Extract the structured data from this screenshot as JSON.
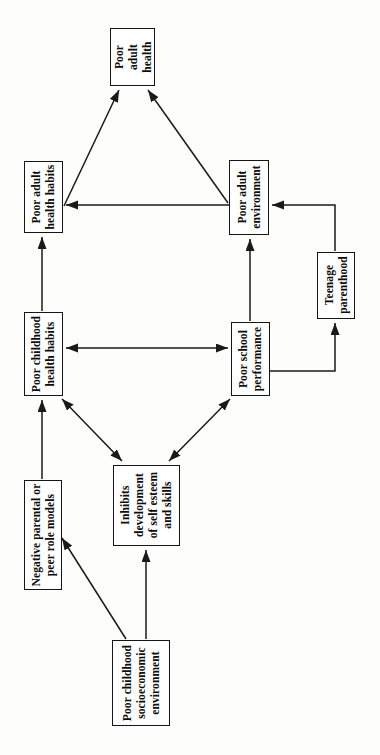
{
  "diagram": {
    "orientation": "rotated-90-counterclockwise",
    "style": {
      "box_border_color": "#151515",
      "box_fill_color": "#ffffff",
      "line_color": "#1a1a1a",
      "background_color": "#fdfdfb"
    },
    "nodes": [
      {
        "id": "poor-adult-health",
        "lines": [
          "Poor",
          "adult",
          "health"
        ],
        "x": 110,
        "y": 28,
        "w": 45,
        "h": 58
      },
      {
        "id": "poor-adult-health-habits",
        "lines": [
          "Poor adult",
          "health habits"
        ],
        "x": 24,
        "y": 161,
        "w": 39,
        "h": 72
      },
      {
        "id": "poor-adult-environment",
        "lines": [
          "Poor adult",
          "environment"
        ],
        "x": 229,
        "y": 160,
        "w": 40,
        "h": 75
      },
      {
        "id": "teenage-parenthood",
        "lines": [
          "Teenage",
          "parenthood"
        ],
        "x": 317,
        "y": 252,
        "w": 38,
        "h": 67
      },
      {
        "id": "poor-childhood-health-habits",
        "lines": [
          "Poor childhood",
          "health habits"
        ],
        "x": 24,
        "y": 312,
        "w": 39,
        "h": 84
      },
      {
        "id": "poor-school-performance",
        "lines": [
          "Poor school",
          "performance"
        ],
        "x": 231,
        "y": 322,
        "w": 39,
        "h": 74
      },
      {
        "id": "inhibits-development-of-self-esteem-and-skills",
        "lines": [
          "Inhibits",
          "development",
          "of self esteem",
          "and skills"
        ],
        "x": 113,
        "y": 465,
        "w": 67,
        "h": 81
      },
      {
        "id": "negative-parental-or-peer-role-models",
        "lines": [
          "Negative parental or",
          "peer role models"
        ],
        "x": 24,
        "y": 480,
        "w": 38,
        "h": 110
      },
      {
        "id": "poor-childhood-socioeconomic-environment",
        "lines": [
          "Poor childhood",
          "socioeconomic",
          "environment"
        ],
        "x": 112,
        "y": 640,
        "w": 58,
        "h": 86
      }
    ],
    "edges": [
      {
        "id": "adult-health-habits-to-adult-health",
        "from": "poor-adult-health-habits",
        "to": "poor-adult-health",
        "arrow": "single"
      },
      {
        "id": "adult-environment-to-adult-health",
        "from": "poor-adult-environment",
        "to": "poor-adult-health",
        "arrow": "single"
      },
      {
        "id": "adult-environment-to-adult-health-habits",
        "from": "poor-adult-environment",
        "to": "poor-adult-health-habits",
        "arrow": "single"
      },
      {
        "id": "teenage-parenthood-to-adult-environment",
        "from": "teenage-parenthood",
        "to": "poor-adult-environment",
        "arrow": "single"
      },
      {
        "id": "school-performance-to-adult-environment",
        "from": "poor-school-performance",
        "to": "poor-adult-environment",
        "arrow": "single"
      },
      {
        "id": "school-performance-to-teenage-parenthood",
        "from": "poor-school-performance",
        "to": "teenage-parenthood",
        "arrow": "single"
      },
      {
        "id": "childhood-health-habits-and-school-performance",
        "from": "poor-school-performance",
        "to": "poor-childhood-health-habits",
        "arrow": "double"
      },
      {
        "id": "childhood-health-habits-to-adult-health-habits",
        "from": "poor-childhood-health-habits",
        "to": "poor-adult-health-habits",
        "arrow": "single"
      },
      {
        "id": "inhibits-development-and-childhood-health-habits",
        "from": "inhibits-development-of-self-esteem-and-skills",
        "to": "poor-childhood-health-habits",
        "arrow": "double"
      },
      {
        "id": "inhibits-development-and-school-performance",
        "from": "inhibits-development-of-self-esteem-and-skills",
        "to": "poor-school-performance",
        "arrow": "double"
      },
      {
        "id": "role-models-to-childhood-health-habits",
        "from": "negative-parental-or-peer-role-models",
        "to": "poor-childhood-health-habits",
        "arrow": "single"
      },
      {
        "id": "socioeconomic-to-role-models",
        "from": "poor-childhood-socioeconomic-environment",
        "to": "negative-parental-or-peer-role-models",
        "arrow": "single"
      },
      {
        "id": "socioeconomic-to-inhibits-development",
        "from": "poor-childhood-socioeconomic-environment",
        "to": "inhibits-development-of-self-esteem-and-skills",
        "arrow": "single"
      }
    ]
  }
}
